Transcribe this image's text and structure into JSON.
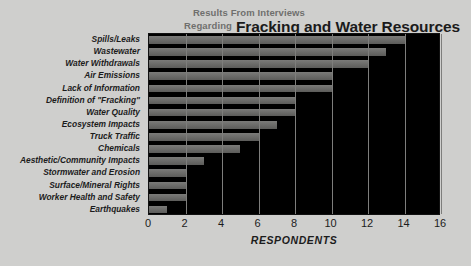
{
  "title": {
    "kicker_line1": "Results From Interviews",
    "kicker_line2": "Regarding",
    "main": "Fracking and Water Resources"
  },
  "axis": {
    "x_title": "RESPONDENTS",
    "x_ticks": [
      "0",
      "2",
      "4",
      "6",
      "8",
      "10",
      "12",
      "14",
      "16"
    ]
  },
  "colors": {
    "background": "#cfcfcd",
    "plot_background": "#000000",
    "bar": "#6d6d6b",
    "gridline": "#7e7e7c",
    "text": "#1c1c1c",
    "kicker_text": "#6f6f6d"
  },
  "chart_data": {
    "type": "bar",
    "orientation": "horizontal",
    "xlabel": "RESPONDENTS",
    "ylabel": "",
    "xlim": [
      0,
      16
    ],
    "xticks": [
      0,
      2,
      4,
      6,
      8,
      10,
      12,
      14,
      16
    ],
    "grid": true,
    "legend": null,
    "categories": [
      "Spills/Leaks",
      "Wastewater",
      "Water Withdrawals",
      "Air Emissions",
      "Lack of Information",
      "Definition of \"Fracking\"",
      "Water Quality",
      "Ecosystem Impacts",
      "Truck Traffic",
      "Chemicals",
      "Aesthetic/Community Impacts",
      "Stormwater and Erosion",
      "Surface/Mineral Rights",
      "Worker Health and Safety",
      "Earthquakes"
    ],
    "values": [
      14,
      13,
      12,
      10,
      10,
      8,
      8,
      7,
      6,
      5,
      3,
      2,
      2,
      2,
      1
    ]
  }
}
